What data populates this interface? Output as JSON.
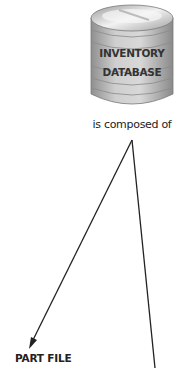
{
  "diagram": {
    "database": {
      "icon": "database-cylinder-icon",
      "label_line1": "INVENTORY",
      "label_line2": "DATABASE"
    },
    "relationship_label": "is composed of",
    "targets": [
      {
        "label": "PART FILE",
        "arrow": "arrowhead"
      },
      {
        "label": "",
        "arrow": "line-continues-offscreen"
      }
    ],
    "colors": {
      "cylinder_body": "#b5b5b5",
      "cylinder_highlight": "#e8e8e8",
      "line": "#222222"
    }
  }
}
